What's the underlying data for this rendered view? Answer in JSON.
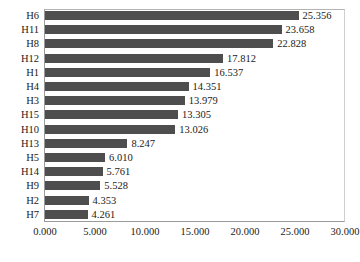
{
  "chart_data": {
    "type": "bar",
    "orientation": "horizontal",
    "title": "",
    "xlabel": "",
    "ylabel": "",
    "xlim": [
      0,
      30
    ],
    "xticks": [
      "0.000",
      "5.000",
      "10.000",
      "15.000",
      "20.000",
      "25.000",
      "30.000"
    ],
    "xtick_values": [
      0,
      5,
      10,
      15,
      20,
      25,
      30
    ],
    "grid": false,
    "legend": false,
    "bar_color": "#4e4e4e",
    "frame_color": "#9a9a9a",
    "background": "#ffffff",
    "categories": [
      "H6",
      "H11",
      "H8",
      "H12",
      "H1",
      "H4",
      "H3",
      "H15",
      "H10",
      "H13",
      "H5",
      "H14",
      "H9",
      "H2",
      "H7"
    ],
    "values": [
      25.356,
      23.658,
      22.828,
      17.812,
      16.537,
      14.351,
      13.979,
      13.305,
      13.026,
      8.247,
      6.01,
      5.761,
      5.528,
      4.353,
      4.261
    ],
    "data_labels": [
      "25.356",
      "23.658",
      "22.828",
      "17.812",
      "16.537",
      "14.351",
      "13.979",
      "13.305",
      "13.026",
      "8.247",
      "6.010",
      "5.761",
      "5.528",
      "4.353",
      "4.261"
    ],
    "rows": [
      {
        "category": "H6",
        "value": 25.356,
        "label": "25.356"
      },
      {
        "category": "H11",
        "value": 23.658,
        "label": "23.658"
      },
      {
        "category": "H8",
        "value": 22.828,
        "label": "22.828"
      },
      {
        "category": "H12",
        "value": 17.812,
        "label": "17.812"
      },
      {
        "category": "H1",
        "value": 16.537,
        "label": "16.537"
      },
      {
        "category": "H4",
        "value": 14.351,
        "label": "14.351"
      },
      {
        "category": "H3",
        "value": 13.979,
        "label": "13.979"
      },
      {
        "category": "H15",
        "value": 13.305,
        "label": "13.305"
      },
      {
        "category": "H10",
        "value": 13.026,
        "label": "13.026"
      },
      {
        "category": "H13",
        "value": 8.247,
        "label": "8.247"
      },
      {
        "category": "H5",
        "value": 6.01,
        "label": "6.010"
      },
      {
        "category": "H14",
        "value": 5.761,
        "label": "5.761"
      },
      {
        "category": "H9",
        "value": 5.528,
        "label": "5.528"
      },
      {
        "category": "H2",
        "value": 4.353,
        "label": "4.353"
      },
      {
        "category": "H7",
        "value": 4.261,
        "label": "4.261"
      }
    ]
  }
}
